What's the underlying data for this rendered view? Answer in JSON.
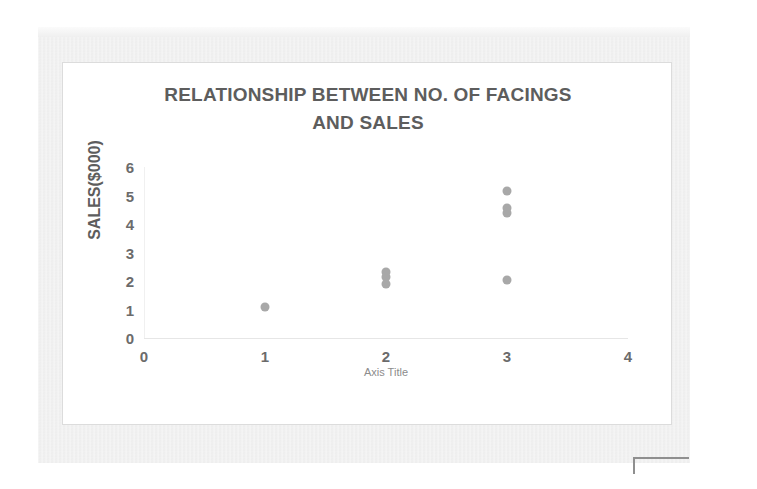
{
  "document": {
    "type": "scanned-page",
    "background_color": "#efefef",
    "card_background_color": "#ffffff",
    "card_border_color": "#dcdcdc"
  },
  "corner_mark": {
    "name": "corner-bracket-mark",
    "color": "#8f8f8f"
  },
  "chart_data": {
    "type": "scatter",
    "title": "RELATIONSHIP BETWEEN NO. OF FACINGS AND SALES",
    "title_line_1": "RELATIONSHIP BETWEEN NO. OF FACINGS",
    "title_line_2": "AND SALES",
    "xlabel": "Axis Title",
    "ylabel": "SALES($000)",
    "xlim": [
      0,
      4
    ],
    "ylim": [
      0,
      6
    ],
    "x_ticks": [
      0,
      1,
      2,
      3,
      4
    ],
    "y_ticks": [
      0,
      1,
      2,
      3,
      4,
      5,
      6
    ],
    "x_tick_labels": [
      "0",
      "1",
      "2",
      "3",
      "4"
    ],
    "y_tick_labels": [
      "0",
      "1",
      "2",
      "3",
      "4",
      "5",
      "6"
    ],
    "grid": false,
    "legend": false,
    "marker_color": "#a8a8a8",
    "title_color": "#5d5d5d",
    "tick_label_color": "#6b6b6b",
    "axis_title_color": "#8c8c8c",
    "points": [
      {
        "x": 1,
        "y": 1.1
      },
      {
        "x": 2,
        "y": 2.3
      },
      {
        "x": 2,
        "y": 2.15
      },
      {
        "x": 2,
        "y": 1.9
      },
      {
        "x": 3,
        "y": 5.15
      },
      {
        "x": 3,
        "y": 4.55
      },
      {
        "x": 3,
        "y": 4.4
      },
      {
        "x": 3,
        "y": 2.05
      }
    ]
  }
}
